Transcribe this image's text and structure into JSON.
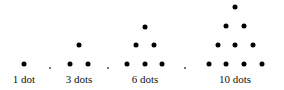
{
  "figure": {
    "groups": [
      {
        "label": "1 dot",
        "count": 1,
        "label_x": 24,
        "dots": [
          [
            24,
            64
          ]
        ]
      },
      {
        "label": "3 dots",
        "count": 3,
        "label_x": 79,
        "dots": [
          [
            79,
            45
          ],
          [
            70,
            64
          ],
          [
            88,
            64
          ]
        ]
      },
      {
        "label": "6 dots",
        "count": 6,
        "label_x": 145,
        "dots": [
          [
            145,
            27
          ],
          [
            136,
            45
          ],
          [
            154,
            45
          ],
          [
            127,
            64
          ],
          [
            145,
            64
          ],
          [
            162,
            64
          ]
        ]
      },
      {
        "label": "10 dots",
        "count": 10,
        "label_x": 235,
        "dots": [
          [
            235,
            7
          ],
          [
            226,
            26
          ],
          [
            244,
            26
          ],
          [
            218,
            45
          ],
          [
            235,
            45
          ],
          [
            253,
            45
          ],
          [
            209,
            64
          ],
          [
            226,
            64
          ],
          [
            244,
            64
          ],
          [
            262,
            64
          ]
        ]
      }
    ],
    "separators": [
      [
        50,
        68
      ],
      [
        108,
        68
      ],
      [
        185,
        68
      ]
    ],
    "dot_color": "#000000"
  }
}
